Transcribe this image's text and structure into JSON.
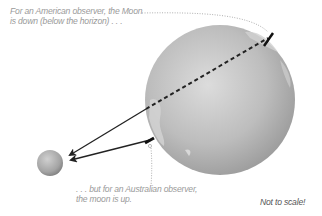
{
  "annotations": {
    "american_line1": "For an American observer, the Moon",
    "american_line2": "is down (below the horizon) . . .",
    "australian_line1": ". . . but for an Australian observer,",
    "australian_line2": "the moon is up.",
    "scale_note": "Not to scale!"
  },
  "objects": {
    "earth": {
      "label": "Earth",
      "cx": 220,
      "cy": 100,
      "r": 75,
      "color": "#b8b8b8"
    },
    "moon": {
      "label": "Moon",
      "cx": 50,
      "cy": 163,
      "r": 13,
      "color": "#a8a8a8"
    }
  },
  "colors": {
    "arrow": "#222222",
    "dotted_leader": "#b0b0b0",
    "text": "#9a9a9a"
  }
}
